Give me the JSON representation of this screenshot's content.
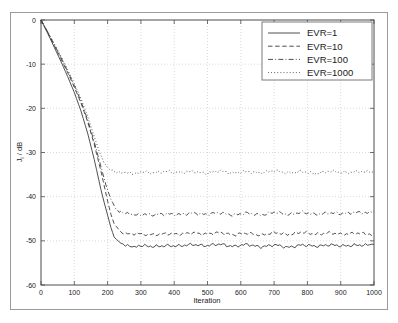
{
  "figure": {
    "frame_color": "#9a9a9a",
    "background": "#ffffff",
    "axis_color": "#4d4d4d",
    "grid_color": "#cccccc",
    "series_color": "#3c3c3c"
  },
  "chart_data": {
    "type": "line",
    "title": "",
    "xlabel": "Iteration",
    "ylabel": "J_i / dB",
    "ylabel_main": "J",
    "ylabel_sub": "i",
    "ylabel_unit": " / dB",
    "xlim": [
      0,
      1000
    ],
    "ylim": [
      -60,
      0
    ],
    "xticks": [
      0,
      100,
      200,
      300,
      400,
      500,
      600,
      700,
      800,
      900,
      1000
    ],
    "xticklabels": [
      "0",
      "100",
      "200",
      "300",
      "400",
      "500",
      "600",
      "700",
      "800",
      "900",
      "1000"
    ],
    "yticks": [
      0,
      -10,
      -20,
      -30,
      -40,
      -50,
      -60
    ],
    "yticklabels": [
      "0",
      "-10",
      "-20",
      "-30",
      "-40",
      "-50",
      "-60"
    ],
    "grid": true,
    "grid_style": "dotted",
    "legend_position": "upper right",
    "series": [
      {
        "name": "EVR=1",
        "linestyle": "solid",
        "floor_db": -51.0,
        "knee_iteration": 215,
        "x": [
          0,
          20,
          40,
          60,
          80,
          100,
          120,
          140,
          160,
          180,
          190,
          200,
          210,
          220,
          240,
          260,
          280,
          300,
          340,
          380,
          420,
          460,
          500,
          540,
          580,
          620,
          660,
          700,
          740,
          780,
          820,
          860,
          900,
          940,
          980,
          1000
        ],
        "y": [
          0,
          -3.0,
          -6.2,
          -9.4,
          -12.8,
          -16.4,
          -20.6,
          -25.6,
          -31.6,
          -38.4,
          -41.4,
          -44.2,
          -47.0,
          -49.2,
          -50.6,
          -51.0,
          -51.2,
          -51.0,
          -51.4,
          -51.0,
          -51.2,
          -50.8,
          -51.1,
          -50.8,
          -51.2,
          -50.9,
          -51.3,
          -51.0,
          -51.4,
          -51.0,
          -51.2,
          -50.9,
          -51.2,
          -50.9,
          -51.1,
          -50.8
        ]
      },
      {
        "name": "EVR=10",
        "linestyle": "dashed",
        "floor_db": -48.5,
        "knee_iteration": 225,
        "x": [
          0,
          20,
          40,
          60,
          80,
          100,
          120,
          140,
          160,
          180,
          200,
          210,
          220,
          240,
          260,
          280,
          300,
          340,
          380,
          420,
          460,
          500,
          540,
          580,
          620,
          660,
          700,
          740,
          780,
          820,
          860,
          900,
          940,
          980,
          1000
        ],
        "y": [
          0,
          -2.8,
          -5.8,
          -8.8,
          -11.9,
          -15.2,
          -18.8,
          -23.0,
          -28.2,
          -34.2,
          -41.0,
          -44.0,
          -46.2,
          -48.0,
          -48.4,
          -48.6,
          -48.4,
          -48.7,
          -48.3,
          -48.6,
          -48.2,
          -48.5,
          -48.2,
          -48.6,
          -48.3,
          -48.6,
          -48.2,
          -48.5,
          -48.1,
          -48.5,
          -48.2,
          -48.6,
          -48.2,
          -48.5,
          -48.3
        ]
      },
      {
        "name": "EVR=100",
        "linestyle": "dashdot",
        "floor_db": -44.0,
        "knee_iteration": 210,
        "x": [
          0,
          20,
          40,
          60,
          80,
          100,
          120,
          140,
          160,
          180,
          195,
          210,
          225,
          240,
          260,
          280,
          300,
          340,
          380,
          420,
          460,
          500,
          540,
          580,
          620,
          660,
          700,
          740,
          780,
          820,
          860,
          900,
          940,
          980,
          1000
        ],
        "y": [
          0,
          -2.7,
          -5.6,
          -8.5,
          -11.6,
          -14.8,
          -18.4,
          -22.6,
          -27.6,
          -33.2,
          -37.4,
          -40.6,
          -42.8,
          -43.6,
          -43.9,
          -44.1,
          -43.9,
          -44.2,
          -43.8,
          -44.1,
          -43.7,
          -44.0,
          -43.7,
          -44.1,
          -43.8,
          -44.1,
          -43.6,
          -44.0,
          -43.6,
          -44.0,
          -43.7,
          -43.9,
          -43.5,
          -43.8,
          -43.5
        ]
      },
      {
        "name": "EVR=1000",
        "linestyle": "dotted",
        "floor_db": -34.5,
        "knee_iteration": 190,
        "x": [
          0,
          20,
          40,
          60,
          80,
          100,
          120,
          140,
          160,
          175,
          190,
          205,
          220,
          240,
          260,
          280,
          300,
          340,
          380,
          420,
          460,
          500,
          540,
          580,
          620,
          660,
          700,
          740,
          780,
          820,
          860,
          900,
          940,
          980,
          1000
        ],
        "y": [
          0,
          -2.6,
          -5.4,
          -8.2,
          -11.2,
          -14.4,
          -17.8,
          -21.8,
          -26.4,
          -29.8,
          -32.4,
          -33.8,
          -34.4,
          -34.6,
          -34.4,
          -34.7,
          -34.3,
          -34.7,
          -34.2,
          -34.6,
          -34.3,
          -34.7,
          -34.2,
          -34.6,
          -34.4,
          -34.5,
          -34.2,
          -34.6,
          -34.3,
          -34.8,
          -34.2,
          -34.6,
          -34.3,
          -34.5,
          -34.4
        ]
      }
    ]
  },
  "legend": {
    "entries": [
      {
        "label": "EVR=1"
      },
      {
        "label": "EVR=10"
      },
      {
        "label": "EVR=100"
      },
      {
        "label": "EVR=1000"
      }
    ]
  }
}
